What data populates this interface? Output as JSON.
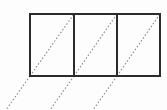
{
  "figure": {
    "background_color": "#fdfdfd",
    "canvas": {
      "width": 167,
      "height": 110
    },
    "outline": {
      "name": "rectangle-row-outline",
      "stroke_color": "#2b2b2b",
      "stroke_width": 2,
      "fill": "none",
      "x": 30,
      "y": 14,
      "width": 130,
      "height": 62
    },
    "dividers": {
      "name": "interior-vertical-dividers",
      "stroke_color": "#2b2b2b",
      "stroke_width": 2,
      "x_positions": [
        74,
        117
      ],
      "y_top": 14,
      "y_bottom": 76
    },
    "cells": [
      {
        "label": "cell-1",
        "x_left": 30,
        "x_right": 74,
        "y_top": 14,
        "y_bottom": 76
      },
      {
        "label": "cell-2",
        "x_left": 74,
        "x_right": 117,
        "y_top": 14,
        "y_bottom": 76
      },
      {
        "label": "cell-3",
        "x_left": 117,
        "x_right": 160,
        "y_top": 14,
        "y_bottom": 76
      }
    ],
    "diagonals": {
      "name": "dotted-diagonal-lines",
      "stroke_color": "#8d8d8d",
      "stroke_width": 1.1,
      "dash_pattern": "1.6 1.9",
      "description": "Each cell carries a dotted diagonal from its bottom-left corner to its top-right corner; each diagonal is extended below-left past the figure to the bottom edge of the canvas.",
      "segments": [
        {
          "label": "diagonal-1",
          "x1": 30,
          "y1": 76,
          "x2": 74,
          "y2": 14
        },
        {
          "label": "diagonal-2",
          "x1": 74,
          "y1": 76,
          "x2": 117,
          "y2": 14
        },
        {
          "label": "diagonal-3",
          "x1": 117,
          "y1": 76,
          "x2": 160,
          "y2": 14
        }
      ],
      "extensions": [
        {
          "label": "diagonal-1-extension",
          "x1": 30,
          "y1": 76,
          "x2": 6,
          "y2": 110
        },
        {
          "label": "diagonal-2-extension",
          "x1": 74,
          "y1": 76,
          "x2": 50,
          "y2": 110
        },
        {
          "label": "diagonal-3-extension",
          "x1": 117,
          "y1": 76,
          "x2": 93,
          "y2": 110
        }
      ]
    }
  }
}
